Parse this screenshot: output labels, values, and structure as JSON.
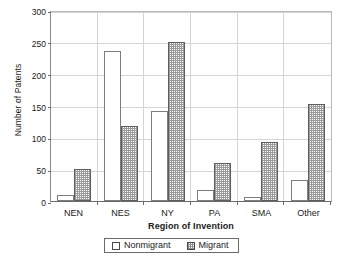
{
  "chart_data": {
    "type": "bar",
    "title": "",
    "xlabel": "Region of Invention",
    "ylabel": "Number of Patents",
    "categories": [
      "NEN",
      "NES",
      "NY",
      "PA",
      "SMA",
      "Other"
    ],
    "series": [
      {
        "name": "Nonmigrant",
        "values": [
          10,
          236,
          141,
          18,
          6,
          33
        ]
      },
      {
        "name": "Migrant",
        "values": [
          50,
          118,
          249,
          60,
          93,
          153
        ]
      }
    ],
    "ylim": [
      0,
      300
    ],
    "yticks": [
      0,
      50,
      100,
      150,
      200,
      250,
      300
    ],
    "ytick_labels": [
      "0",
      "50",
      "100",
      "150",
      "200",
      "250",
      "300"
    ],
    "grid": true,
    "legend_position": "bottom-center",
    "legend_entries": [
      "Nonmigrant",
      "Migrant"
    ]
  },
  "colors": {
    "axis": "#6a6a6a",
    "grid": "#d5d5d5",
    "nonmigrant_fill": "#ffffff",
    "nonmigrant_edge": "#7d7d7d",
    "migrant_hatch": "#9a9a9a",
    "migrant_edge": "#5e5e5e",
    "text": "#1a1a1a"
  }
}
